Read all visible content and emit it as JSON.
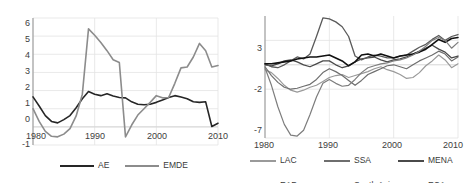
{
  "figure": {
    "background": "#ffffff",
    "panel_count": 2
  },
  "chart_data": [
    {
      "type": "line",
      "id": "left-panel",
      "title": "",
      "xlabel": "",
      "ylabel": "",
      "xlim": [
        1980,
        2010
      ],
      "ylim": [
        -1,
        6
      ],
      "xticks": [
        1980,
        1990,
        2000,
        2010
      ],
      "yticks": [
        -1,
        0,
        1,
        2,
        3,
        4,
        5,
        6
      ],
      "xticklabels": [
        "1980",
        "1990",
        "2000",
        "2010"
      ],
      "yticklabels": [
        "-1",
        "0",
        "1",
        "2",
        "3",
        "4",
        "5",
        "6"
      ],
      "grid": "both-light",
      "legend_position": "bottom-center",
      "x": [
        1980,
        1981,
        1982,
        1983,
        1984,
        1985,
        1986,
        1987,
        1988,
        1989,
        1990,
        1991,
        1992,
        1993,
        1994,
        1995,
        1996,
        1997,
        1998,
        1999,
        2000,
        2001,
        2002,
        2003,
        2004,
        2005,
        2006,
        2007,
        2008,
        2009,
        2010
      ],
      "series": [
        {
          "name": "AE",
          "color": "#262626",
          "width": 1.6,
          "values": [
            1.65,
            1.15,
            0.62,
            0.3,
            0.22,
            0.4,
            0.62,
            1.05,
            1.55,
            1.95,
            1.8,
            1.72,
            1.82,
            1.7,
            1.62,
            1.6,
            1.38,
            1.25,
            1.22,
            1.25,
            1.35,
            1.48,
            1.62,
            1.72,
            1.65,
            1.55,
            1.38,
            1.35,
            1.38,
            0.02,
            0.2
          ]
        },
        {
          "name": "EMDE",
          "color": "#8c8c8c",
          "width": 1.6,
          "values": [
            1.0,
            0.3,
            -0.25,
            -0.52,
            -0.55,
            -0.4,
            -0.1,
            0.6,
            1.8,
            5.4,
            5.05,
            4.65,
            4.2,
            3.7,
            3.55,
            -0.55,
            0.1,
            0.65,
            1.0,
            1.35,
            1.72,
            1.6,
            1.62,
            2.4,
            3.25,
            3.3,
            3.85,
            4.6,
            4.2,
            3.3,
            3.38
          ]
        }
      ]
    },
    {
      "type": "line",
      "id": "right-panel",
      "title": "",
      "xlabel": "",
      "ylabel": "",
      "xlim": [
        1980,
        2010
      ],
      "ylim": [
        -7,
        5.5
      ],
      "xticks": [
        1980,
        1990,
        2000,
        2010
      ],
      "yticks": [
        -7,
        -2,
        3
      ],
      "xticklabels": [
        "1980",
        "1990",
        "2000",
        "2010"
      ],
      "yticklabels": [
        "-7",
        "-2",
        "3"
      ],
      "grid": "both-light",
      "legend_position": "bottom",
      "x": [
        1980,
        1981,
        1982,
        1983,
        1984,
        1985,
        1986,
        1987,
        1988,
        1989,
        1990,
        1991,
        1992,
        1993,
        1994,
        1995,
        1996,
        1997,
        1998,
        1999,
        2000,
        2001,
        2002,
        2003,
        2004,
        2005,
        2006,
        2007,
        2008,
        2009,
        2010
      ],
      "series": [
        {
          "name": "LAC",
          "color": "#9a9a9a",
          "width": 1.2,
          "values": [
            0.0,
            -0.3,
            -0.9,
            -1.6,
            -2.1,
            -2.3,
            -2.1,
            -1.8,
            -1.6,
            -1.2,
            -0.8,
            -0.6,
            -0.5,
            -0.8,
            -0.6,
            -0.4,
            -0.2,
            0.1,
            0.3,
            0.0,
            -0.2,
            -0.5,
            -0.9,
            -0.8,
            -0.3,
            0.4,
            0.9,
            1.5,
            1.0,
            0.2,
            0.6
          ]
        },
        {
          "name": "SSA",
          "color": "#6e6e6e",
          "width": 1.2,
          "values": [
            0.3,
            -0.6,
            -1.3,
            -1.8,
            -2.0,
            -1.9,
            -1.7,
            -1.5,
            -1.0,
            -0.3,
            0.1,
            -0.2,
            -0.6,
            -1.1,
            -1.6,
            -1.1,
            -0.5,
            -0.2,
            0.1,
            0.4,
            0.5,
            0.3,
            0.1,
            0.5,
            0.9,
            1.2,
            1.5,
            1.9,
            1.6,
            0.9,
            1.3
          ]
        },
        {
          "name": "MENA",
          "color": "#4a4a4a",
          "width": 1.3,
          "values": [
            0.5,
            0.4,
            0.6,
            0.9,
            1.0,
            0.8,
            0.5,
            0.3,
            0.6,
            0.9,
            0.9,
            0.5,
            0.2,
            0.4,
            0.8,
            1.1,
            1.2,
            1.3,
            1.0,
            0.8,
            1.0,
            1.1,
            1.3,
            1.6,
            1.9,
            2.2,
            2.5,
            2.1,
            1.8,
            1.2,
            1.4
          ]
        },
        {
          "name": "EAP",
          "color": "#5a5a5a",
          "width": 1.3,
          "values": [
            0.6,
            0.3,
            0.2,
            0.5,
            0.9,
            1.3,
            1.1,
            1.6,
            3.4,
            5.3,
            5.2,
            4.9,
            4.4,
            3.4,
            1.4,
            1.0,
            1.3,
            1.5,
            1.4,
            1.2,
            1.2,
            1.4,
            1.5,
            1.9,
            2.3,
            2.6,
            3.1,
            3.5,
            3.0,
            3.4,
            3.6
          ]
        },
        {
          "name": "South Asia",
          "color": "#111111",
          "width": 1.6,
          "values": [
            0.6,
            0.6,
            0.7,
            0.8,
            0.9,
            1.1,
            1.2,
            1.3,
            1.3,
            1.4,
            1.5,
            1.2,
            0.9,
            0.4,
            0.8,
            1.5,
            1.6,
            1.4,
            1.6,
            1.4,
            1.2,
            1.4,
            1.5,
            1.6,
            1.8,
            2.1,
            2.6,
            3.1,
            2.8,
            3.2,
            3.3
          ]
        },
        {
          "name": "ECA",
          "color": "#7d7d7d",
          "width": 1.2,
          "values": [
            0.2,
            -1.6,
            -3.8,
            -5.6,
            -6.7,
            -6.8,
            -6.2,
            -4.6,
            -2.8,
            -1.4,
            -1.0,
            -1.4,
            -1.7,
            -1.6,
            -1.0,
            -0.3,
            0.2,
            0.4,
            0.6,
            0.7,
            0.9,
            1.0,
            1.2,
            1.5,
            1.9,
            2.4,
            3.0,
            3.3,
            3.0,
            2.2,
            2.8
          ]
        }
      ]
    }
  ],
  "left_panel": {
    "yticklabels": [
      "6",
      "5",
      "4",
      "3",
      "2",
      "1",
      "0",
      "-1"
    ],
    "xticklabels": [
      "1980",
      "1990",
      "2000",
      "2010"
    ],
    "legend": [
      {
        "label": "AE",
        "color": "#262626",
        "width": 2
      },
      {
        "label": "EMDE",
        "color": "#8c8c8c",
        "width": 2
      }
    ]
  },
  "right_panel": {
    "yticklabels": [
      "3",
      "-2",
      "-7"
    ],
    "xticklabels": [
      "1980",
      "1990",
      "2000",
      "2010"
    ],
    "legend_rows": [
      [
        {
          "label": "LAC",
          "color": "#9a9a9a",
          "width": 2
        },
        {
          "label": "SSA",
          "color": "#6e6e6e",
          "width": 2
        },
        {
          "label": "MENA",
          "color": "#4a4a4a",
          "width": 2
        }
      ],
      [
        {
          "label": "EAP",
          "color": "#5a5a5a",
          "width": 2
        },
        {
          "label": "South Asia",
          "color": "#111111",
          "width": 2.4
        },
        {
          "label": "ECA",
          "color": "#7d7d7d",
          "width": 2
        }
      ]
    ]
  }
}
